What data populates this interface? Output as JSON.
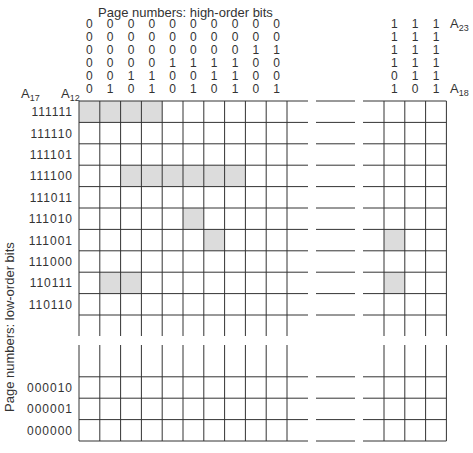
{
  "title": "Page numbers: high-order bits",
  "y_axis_label": "Page numbers: low-order bits",
  "labels": {
    "a17": {
      "base": "A",
      "sub": "17"
    },
    "a12": {
      "base": "A",
      "sub": "12"
    },
    "a23": {
      "base": "A",
      "sub": "23"
    },
    "a18": {
      "base": "A",
      "sub": "18"
    }
  },
  "high_order_bits_left": [
    [
      "0",
      "0",
      "0",
      "0",
      "0",
      "0"
    ],
    [
      "0",
      "0",
      "0",
      "0",
      "0",
      "1"
    ],
    [
      "0",
      "0",
      "0",
      "0",
      "1",
      "0"
    ],
    [
      "0",
      "0",
      "0",
      "0",
      "1",
      "1"
    ],
    [
      "0",
      "0",
      "0",
      "1",
      "0",
      "0"
    ],
    [
      "0",
      "0",
      "0",
      "1",
      "0",
      "1"
    ],
    [
      "0",
      "0",
      "0",
      "1",
      "1",
      "0"
    ],
    [
      "0",
      "0",
      "0",
      "1",
      "1",
      "1"
    ],
    [
      "0",
      "0",
      "1",
      "0",
      "0",
      "0"
    ],
    [
      "0",
      "0",
      "1",
      "0",
      "0",
      "1"
    ]
  ],
  "high_order_bits_right": [
    [
      "1",
      "1",
      "1",
      "1",
      "0",
      "1"
    ],
    [
      "1",
      "1",
      "1",
      "1",
      "1",
      "0"
    ],
    [
      "1",
      "1",
      "1",
      "1",
      "1",
      "1"
    ]
  ],
  "row_labels_top": [
    "111111",
    "111110",
    "111101",
    "111100",
    "111011",
    "111010",
    "111001",
    "111000",
    "110111",
    "110110"
  ],
  "row_labels_bottom": [
    "000010",
    "000001",
    "000000"
  ],
  "shading_color": "#dcdcdc",
  "shaded_cells_left": [
    {
      "row": 0,
      "col": 0
    },
    {
      "row": 0,
      "col": 1
    },
    {
      "row": 0,
      "col": 2
    },
    {
      "row": 0,
      "col": 3
    },
    {
      "row": 3,
      "col": 2
    },
    {
      "row": 3,
      "col": 3
    },
    {
      "row": 3,
      "col": 4
    },
    {
      "row": 3,
      "col": 5
    },
    {
      "row": 3,
      "col": 6
    },
    {
      "row": 3,
      "col": 7
    },
    {
      "row": 5,
      "col": 5
    },
    {
      "row": 6,
      "col": 6
    },
    {
      "row": 8,
      "col": 1
    },
    {
      "row": 8,
      "col": 2
    }
  ],
  "shaded_cells_right": [
    {
      "row": 6,
      "col": 0
    },
    {
      "row": 8,
      "col": 0
    }
  ]
}
